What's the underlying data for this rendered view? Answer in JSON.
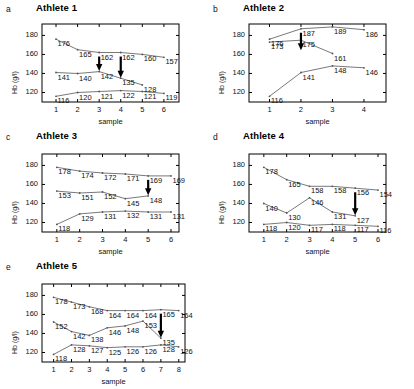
{
  "figure": {
    "axis_label_y": "Hb (g/l)",
    "axis_label_x": "sample",
    "yticks": [
      "120",
      "140",
      "160",
      "180"
    ],
    "ylim": [
      110,
      192
    ],
    "series_color": "#555555",
    "arrow_color": "#000000",
    "axis_color": "#000000"
  },
  "panels": [
    {
      "letter": "a",
      "title": "Athlete 1",
      "xticks": [
        "1",
        "2",
        "3",
        "4",
        "5",
        "6"
      ],
      "xmax": 6.7,
      "arrows": [
        3,
        4
      ],
      "series": [
        {
          "name": "top",
          "x": [
            1,
            2,
            3,
            4,
            5,
            6
          ],
          "values": [
            176,
            165,
            162,
            162,
            160,
            157
          ]
        },
        {
          "name": "middle",
          "x": [
            1,
            2,
            3,
            4,
            5
          ],
          "values": [
            141,
            140,
            142,
            135,
            128
          ]
        },
        {
          "name": "bottom",
          "x": [
            1,
            2,
            3,
            4,
            5,
            6
          ],
          "values": [
            116,
            120,
            121,
            122,
            121,
            119
          ]
        }
      ]
    },
    {
      "letter": "b",
      "title": "Athlete 2",
      "xticks": [
        "1",
        "2",
        "3",
        "4"
      ],
      "xmax": 4.7,
      "arrows": [
        2
      ],
      "series": [
        {
          "name": "top",
          "x": [
            1,
            2,
            3,
            4
          ],
          "values": [
            176,
            187,
            189,
            186
          ]
        },
        {
          "name": "middle",
          "x": [
            1,
            2,
            3
          ],
          "values": [
            173,
            175,
            161
          ]
        },
        {
          "name": "bottom",
          "x": [
            1,
            2,
            3,
            4
          ],
          "values": [
            116,
            141,
            148,
            146
          ]
        }
      ]
    },
    {
      "letter": "c",
      "title": "Athlete 3",
      "xticks": [
        "1",
        "2",
        "3",
        "4",
        "5",
        "6"
      ],
      "xmax": 6.35,
      "arrows": [
        5
      ],
      "series": [
        {
          "name": "top",
          "x": [
            1,
            2,
            3,
            4,
            5,
            6
          ],
          "values": [
            178,
            174,
            172,
            171,
            169,
            169
          ]
        },
        {
          "name": "middle",
          "x": [
            1,
            2,
            3,
            4,
            5
          ],
          "values": [
            153,
            151,
            152,
            145,
            148
          ]
        },
        {
          "name": "bottom",
          "x": [
            1,
            2,
            3,
            4,
            5,
            6
          ],
          "values": [
            118,
            129,
            131,
            132,
            131,
            131
          ]
        }
      ]
    },
    {
      "letter": "d",
      "title": "Athlete 4",
      "xticks": [
        "1",
        "2",
        "3",
        "4",
        "5",
        "6"
      ],
      "xmax": 6.35,
      "arrows": [
        5
      ],
      "series": [
        {
          "name": "top",
          "x": [
            1,
            2,
            3,
            4,
            5,
            6
          ],
          "values": [
            178,
            165,
            158,
            158,
            156,
            154
          ]
        },
        {
          "name": "middle",
          "x": [
            1,
            2,
            3,
            4,
            5
          ],
          "values": [
            140,
            130,
            146,
            131,
            127
          ]
        },
        {
          "name": "bottom",
          "x": [
            1,
            2,
            3,
            4,
            5,
            6
          ],
          "values": [
            118,
            120,
            117,
            118,
            117,
            116
          ]
        }
      ]
    },
    {
      "letter": "e",
      "title": "Athlete 5",
      "xticks": [
        "1",
        "2",
        "3",
        "4",
        "5",
        "6",
        "7",
        "8"
      ],
      "xmax": 8.35,
      "arrows": [
        7
      ],
      "series": [
        {
          "name": "top",
          "x": [
            1,
            2,
            3,
            4,
            5,
            6,
            7,
            8
          ],
          "values": [
            178,
            173,
            168,
            164,
            164,
            164,
            165,
            164
          ]
        },
        {
          "name": "middle",
          "x": [
            1,
            2,
            3,
            4,
            5,
            6,
            7
          ],
          "values": [
            152,
            142,
            138,
            146,
            148,
            153,
            135
          ]
        },
        {
          "name": "bottom",
          "x": [
            1,
            2,
            3,
            4,
            5,
            6,
            7,
            8
          ],
          "values": [
            118,
            128,
            127,
            125,
            126,
            126,
            128,
            126
          ]
        }
      ]
    }
  ],
  "chart_data": {
    "type": "line",
    "xlabel": "sample",
    "ylabel": "Hb (g/l)",
    "ylim": [
      110,
      192
    ],
    "yticks": [
      120,
      140,
      160,
      180
    ],
    "grid": false,
    "legend": "none",
    "annotations": "black downward arrows mark sampling points of interest",
    "panels": [
      {
        "panel": "a",
        "title": "Athlete 1",
        "x": [
          1,
          2,
          3,
          4,
          5,
          6
        ],
        "arrows_at_x": [
          3,
          4
        ],
        "series": [
          {
            "name": "upper",
            "values": [
              176,
              165,
              162,
              162,
              160,
              157
            ]
          },
          {
            "name": "middle",
            "values": [
              141,
              140,
              142,
              135,
              128,
              null
            ]
          },
          {
            "name": "lower",
            "values": [
              116,
              120,
              121,
              122,
              121,
              119
            ]
          }
        ]
      },
      {
        "panel": "b",
        "title": "Athlete 2",
        "x": [
          1,
          2,
          3,
          4
        ],
        "arrows_at_x": [
          2
        ],
        "series": [
          {
            "name": "upper",
            "values": [
              176,
              187,
              189,
              186
            ]
          },
          {
            "name": "middle",
            "values": [
              173,
              175,
              161,
              null
            ]
          },
          {
            "name": "lower",
            "values": [
              116,
              141,
              148,
              146
            ]
          }
        ]
      },
      {
        "panel": "c",
        "title": "Athlete 3",
        "x": [
          1,
          2,
          3,
          4,
          5,
          6
        ],
        "arrows_at_x": [
          5
        ],
        "series": [
          {
            "name": "upper",
            "values": [
              178,
              174,
              172,
              171,
              169,
              169
            ]
          },
          {
            "name": "middle",
            "values": [
              153,
              151,
              152,
              145,
              148,
              null
            ]
          },
          {
            "name": "lower",
            "values": [
              118,
              129,
              131,
              132,
              131,
              131
            ]
          }
        ]
      },
      {
        "panel": "d",
        "title": "Athlete 4",
        "x": [
          1,
          2,
          3,
          4,
          5,
          6
        ],
        "arrows_at_x": [
          5
        ],
        "series": [
          {
            "name": "upper",
            "values": [
              178,
              165,
              158,
              158,
              156,
              154
            ]
          },
          {
            "name": "middle",
            "values": [
              140,
              130,
              146,
              131,
              127,
              null
            ]
          },
          {
            "name": "lower",
            "values": [
              118,
              120,
              117,
              118,
              117,
              116
            ]
          }
        ]
      },
      {
        "panel": "e",
        "title": "Athlete 5",
        "x": [
          1,
          2,
          3,
          4,
          5,
          6,
          7,
          8
        ],
        "arrows_at_x": [
          7
        ],
        "series": [
          {
            "name": "upper",
            "values": [
              178,
              173,
              168,
              164,
              164,
              164,
              165,
              164
            ]
          },
          {
            "name": "middle",
            "values": [
              152,
              142,
              138,
              146,
              148,
              153,
              135,
              null
            ]
          },
          {
            "name": "lower",
            "values": [
              118,
              128,
              127,
              125,
              126,
              126,
              128,
              126
            ]
          }
        ]
      }
    ]
  }
}
